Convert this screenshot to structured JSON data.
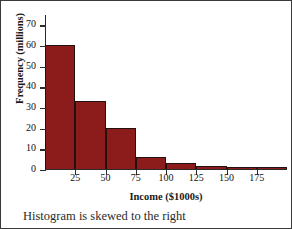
{
  "chart_data": {
    "type": "bar",
    "title": "",
    "subtitle": "",
    "xlabel": "Income ($1000s)",
    "ylabel": "Frequency (millions)",
    "caption": "Histogram is skewed to the right",
    "grid": false,
    "legend": null,
    "bin_width": 25,
    "xlim": [
      0,
      200
    ],
    "ylim": [
      0,
      75
    ],
    "x_ticks": [
      25,
      50,
      75,
      100,
      125,
      150,
      175
    ],
    "y_ticks": [
      0,
      10,
      20,
      30,
      40,
      50,
      60,
      70
    ],
    "bin_edges": [
      0,
      25,
      50,
      75,
      100,
      125,
      150,
      175,
      200
    ],
    "categories": [
      "0-25",
      "25-50",
      "50-75",
      "75-100",
      "100-125",
      "125-150",
      "150-175",
      "175-200"
    ],
    "values": [
      60,
      33,
      20,
      6,
      3,
      1.5,
      0.8,
      0.8
    ],
    "bar_color": "#8c1c1c",
    "bar_edge_color": "#231010",
    "axis_color": "#2b2b2b"
  }
}
